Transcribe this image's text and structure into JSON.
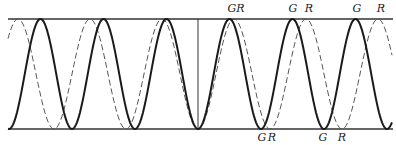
{
  "diagram": {
    "frame": {
      "top_y": 19,
      "bottom_y": 129,
      "left_x": 8,
      "right_x": 393,
      "center_x": 198
    },
    "series": [
      {
        "name": "G",
        "style": "solid",
        "color": "#1a1a1a",
        "period_px": 63,
        "phase_min_x": 198
      },
      {
        "name": "R",
        "style": "dashed",
        "color": "#555555",
        "period_px": 72,
        "phase_min_x": 198
      }
    ],
    "labels_top": [
      {
        "text": "GR",
        "x": 236,
        "y": 12
      },
      {
        "text": "G",
        "x": 293,
        "y": 12
      },
      {
        "text": "R",
        "x": 309,
        "y": 12
      },
      {
        "text": "G",
        "x": 357,
        "y": 12
      },
      {
        "text": "R",
        "x": 381,
        "y": 12
      }
    ],
    "labels_bottom": [
      {
        "text": "G",
        "x": 262,
        "y": 141
      },
      {
        "text": "R",
        "x": 272,
        "y": 141
      },
      {
        "text": "G",
        "x": 323,
        "y": 141
      },
      {
        "text": "R",
        "x": 342,
        "y": 141
      }
    ]
  }
}
